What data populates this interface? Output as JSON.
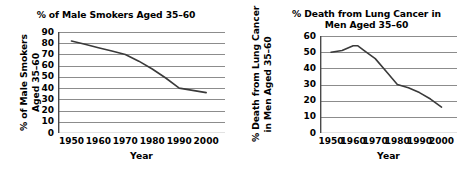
{
  "figure": {
    "background": "#ffffff",
    "line_color": "#3a3a3a",
    "grid_color": "#8c8c8c",
    "axis_color": "#4a4a4a",
    "text_color": "#000000"
  },
  "charts": [
    {
      "id": "male-smokers",
      "chart_data": {
        "type": "line",
        "title": "% of Male Smokers Aged 35–60",
        "xlabel": "Year",
        "ylabel": "% of Male Smokers Aged 35–60",
        "ylabel_line1": "% of Male Smokers",
        "ylabel_line2": "Aged 35–60",
        "grid": true,
        "grid_orientation": "horizontal",
        "legend": "none",
        "xlim": [
          1945,
          2007
        ],
        "ylim": [
          0,
          90
        ],
        "xticks": [
          1950,
          1960,
          1970,
          1980,
          1990,
          2000
        ],
        "xtick_labels": [
          "1950",
          "1960",
          "1970",
          "1980",
          "1990",
          "2000"
        ],
        "yticks": [
          0,
          10,
          20,
          30,
          40,
          50,
          60,
          70,
          80,
          90
        ],
        "ytick_labels": [
          "0",
          "10",
          "20",
          "30",
          "40",
          "50",
          "60",
          "70",
          "80",
          "90"
        ],
        "x": [
          1950,
          1955,
          1960,
          1965,
          1970,
          1975,
          1980,
          1985,
          1990,
          1995,
          2000
        ],
        "values": [
          82,
          79,
          76,
          73,
          70,
          64,
          57,
          49,
          40,
          38,
          36
        ]
      }
    },
    {
      "id": "lung-cancer-death",
      "chart_data": {
        "type": "line",
        "title": "% Death from Lung Cancer in Men Aged 35–60",
        "title_line1": "% Death from Lung Cancer in",
        "title_line2": "Men Aged 35–60",
        "xlabel": "Year",
        "ylabel": "% Death from Lung Cancer in Men Aged 35–60",
        "ylabel_line1": "% Death from Lung Cancer",
        "ylabel_line2": "in Men Aged 35–60",
        "grid": true,
        "grid_orientation": "horizontal",
        "legend": "none",
        "xlim": [
          1945,
          2007
        ],
        "ylim": [
          0,
          60
        ],
        "xticks": [
          1950,
          1960,
          1970,
          1980,
          1990,
          2000
        ],
        "xtick_labels": [
          "1950",
          "1960",
          "1970",
          "1980",
          "1990",
          "2000"
        ],
        "yticks": [
          0,
          10,
          20,
          30,
          40,
          50,
          60
        ],
        "ytick_labels": [
          "0",
          "10",
          "20",
          "30",
          "40",
          "50",
          "60"
        ],
        "x": [
          1950,
          1955,
          1960,
          1962,
          1965,
          1970,
          1975,
          1980,
          1985,
          1990,
          1995,
          2000
        ],
        "values": [
          50,
          51,
          54,
          54,
          51,
          46,
          38,
          30,
          28,
          25,
          21,
          16
        ]
      }
    }
  ]
}
